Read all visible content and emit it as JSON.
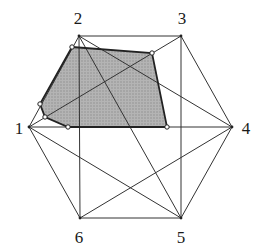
{
  "diagram": {
    "type": "complete-graph-hexagon-with-shaded-region",
    "vertices": [
      {
        "id": "1",
        "label": "1",
        "x": 29,
        "y": 127,
        "lx": 19,
        "ly": 128
      },
      {
        "id": "2",
        "label": "2",
        "x": 79,
        "y": 36,
        "lx": 78,
        "ly": 18
      },
      {
        "id": "3",
        "label": "3",
        "x": 181,
        "y": 36,
        "lx": 182,
        "ly": 18
      },
      {
        "id": "4",
        "label": "4",
        "x": 232,
        "y": 127,
        "lx": 246,
        "ly": 128
      },
      {
        "id": "5",
        "label": "5",
        "x": 181,
        "y": 218,
        "lx": 181,
        "ly": 237
      },
      {
        "id": "6",
        "label": "6",
        "x": 80,
        "y": 218,
        "lx": 79,
        "ly": 237
      }
    ],
    "edges": [
      [
        "1",
        "2"
      ],
      [
        "2",
        "3"
      ],
      [
        "3",
        "4"
      ],
      [
        "4",
        "5"
      ],
      [
        "5",
        "6"
      ],
      [
        "6",
        "1"
      ],
      [
        "2",
        "6"
      ],
      [
        "3",
        "5"
      ],
      [
        "1",
        "4"
      ],
      [
        "2",
        "4"
      ],
      [
        "2",
        "5"
      ],
      [
        "1",
        "3"
      ],
      [
        "1",
        "5"
      ],
      [
        "6",
        "4"
      ]
    ],
    "shaded_region": {
      "fill": "#a9a9a9",
      "stroke": "#222222",
      "points": [
        [
          72,
          47
        ],
        [
          152,
          53
        ],
        [
          167,
          127
        ],
        [
          68,
          127
        ],
        [
          45,
          117
        ],
        [
          40,
          104
        ]
      ]
    },
    "colors": {
      "line": "#333333",
      "label": "#1a1a1a",
      "marker_fill": "#ffffff"
    }
  }
}
